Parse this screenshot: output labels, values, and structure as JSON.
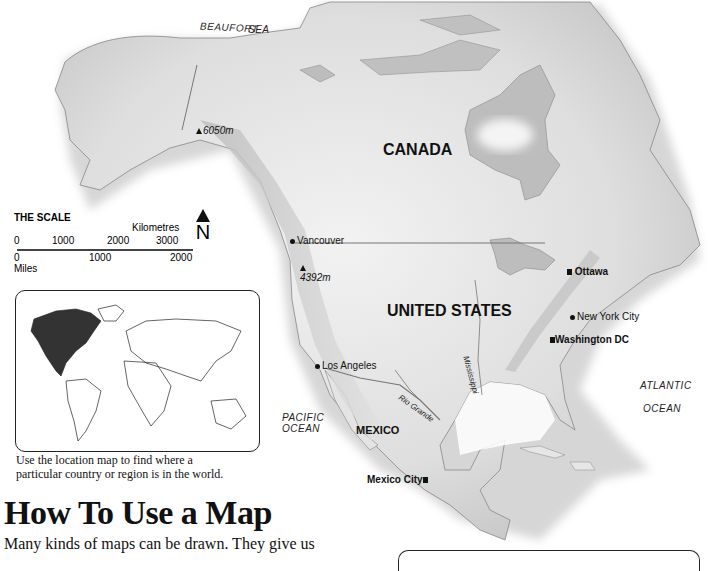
{
  "map": {
    "seas": {
      "beaufort": "BEAUFORT",
      "beaufort2": "SEA",
      "pacific1": "PACIFIC",
      "pacific2": "OCEAN",
      "atlantic1": "ATLANTIC",
      "atlantic2": "OCEAN"
    },
    "countries": {
      "canada": "CANADA",
      "usa": "UNITED STATES",
      "mexico": "MEXICO"
    },
    "cities": {
      "vancouver": "Vancouver",
      "ottawa": "Ottawa",
      "new_york": "New York City",
      "washington": "Washington DC",
      "los_angeles": "Los Angeles",
      "mexico_city": "Mexico City"
    },
    "peaks": {
      "mckinley": "6050m",
      "rainier": "4392m"
    },
    "rivers": {
      "mississippi": "Mississippi",
      "rio_grande": "Rio Grande"
    },
    "colors": {
      "land": "#eeeeee",
      "land_shade": "#c8c8c8",
      "water_inland": "#bdbdbd",
      "sea": "#ffffff"
    }
  },
  "scale": {
    "title": "THE SCALE",
    "km_unit": "Kilometres",
    "mi_unit": "Miles",
    "km_ticks": [
      "0",
      "1000",
      "2000",
      "3000"
    ],
    "mi_ticks": [
      "0",
      "1000",
      "2000"
    ],
    "north_label": "N"
  },
  "locator": {
    "caption_line1": "Use the location map to find where a",
    "caption_line2": "particular country or region is in the world.",
    "highlight_region": "North America"
  },
  "article": {
    "heading": "How To Use a Map",
    "intro": "Many kinds of maps can be drawn. They give us"
  }
}
